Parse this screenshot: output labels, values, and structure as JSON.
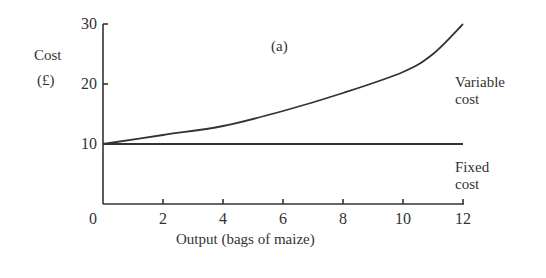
{
  "chart_data": {
    "type": "line",
    "title": "(a)",
    "xlabel": "Output (bags of maize)",
    "ylabel": "Cost (£)",
    "ylabel_lines": [
      "Cost",
      "(£)"
    ],
    "x_ticks": [
      "0",
      "2",
      "4",
      "6",
      "8",
      "10",
      "12"
    ],
    "y_ticks": [
      "10",
      "20",
      "30"
    ],
    "xlim": [
      0,
      12
    ],
    "ylim": [
      0,
      30
    ],
    "grid": false,
    "x": [
      0,
      2,
      4,
      6,
      8,
      10,
      11,
      12
    ],
    "series": [
      {
        "name": "Variable cost",
        "label_lines": [
          "Variable",
          "cost"
        ],
        "values": [
          10,
          11.5,
          13,
          15.5,
          18.5,
          22,
          25,
          30
        ]
      },
      {
        "name": "Fixed cost",
        "label_lines": [
          "Fixed",
          "cost"
        ],
        "values": [
          10,
          10,
          10,
          10,
          10,
          10,
          10,
          10
        ]
      }
    ]
  }
}
